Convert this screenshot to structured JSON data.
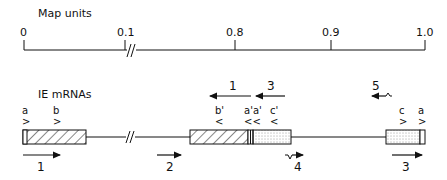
{
  "map": {
    "title": "Map units",
    "ticks": [
      {
        "label": "0",
        "x": 24
      },
      {
        "label": "0.1",
        "x": 125
      },
      {
        "label": "0.8",
        "x": 235
      },
      {
        "label": "0.9",
        "x": 331
      },
      {
        "label": "1.0",
        "x": 425
      }
    ],
    "break_symbol": "//"
  },
  "mrnas": {
    "title": "IE mRNAs",
    "sites": {
      "a": "a",
      "b": "b",
      "b_prime": "b'",
      "a_prime": "a'a'",
      "c_prime": "c'",
      "c": "c",
      "a_right": "a"
    },
    "site_markers": {
      "right": ">",
      "left": "<",
      "left_double": "<<"
    },
    "transcripts": [
      {
        "label": "1",
        "direction": "right"
      },
      {
        "label": "2",
        "direction": "right"
      },
      {
        "label": "1",
        "direction": "left"
      },
      {
        "label": "3",
        "direction": "left"
      },
      {
        "label": "4",
        "direction": "right"
      },
      {
        "label": "5",
        "direction": "left"
      },
      {
        "label": "3",
        "direction": "right"
      }
    ]
  },
  "colors": {
    "ink": "#111111",
    "background": "#ffffff"
  }
}
